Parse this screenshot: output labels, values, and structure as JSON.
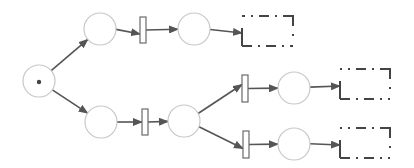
{
  "diagram": {
    "type": "petri-net",
    "colors": {
      "place_stroke": "#c8c8c8",
      "transition_stroke": "#6a6a6a",
      "arc": "#555555",
      "terminal": "#444444",
      "token": "#444444"
    },
    "places": [
      {
        "id": "p0",
        "cx": 39,
        "cy": 81,
        "r": 16,
        "tokens": 1
      },
      {
        "id": "p1",
        "cx": 100,
        "cy": 29,
        "r": 16,
        "tokens": 0
      },
      {
        "id": "p2",
        "cx": 194,
        "cy": 29,
        "r": 16,
        "tokens": 0
      },
      {
        "id": "p3",
        "cx": 101,
        "cy": 122,
        "r": 16,
        "tokens": 0
      },
      {
        "id": "p4",
        "cx": 184,
        "cy": 121,
        "r": 16,
        "tokens": 0
      },
      {
        "id": "p5",
        "cx": 294,
        "cy": 88,
        "r": 16,
        "tokens": 0
      },
      {
        "id": "p6",
        "cx": 294,
        "cy": 144,
        "r": 16,
        "tokens": 0
      }
    ],
    "transitions": [
      {
        "id": "t1",
        "x": 140,
        "y": 17,
        "w": 6,
        "h": 26
      },
      {
        "id": "t2",
        "x": 142,
        "y": 109,
        "w": 6,
        "h": 26
      },
      {
        "id": "t3",
        "x": 242,
        "y": 75,
        "w": 6,
        "h": 27
      },
      {
        "id": "t4",
        "x": 243,
        "y": 131,
        "w": 6,
        "h": 27
      }
    ],
    "terminals": [
      {
        "id": "end1",
        "x": 242,
        "y": 16,
        "w": 51,
        "h": 30
      },
      {
        "id": "end2",
        "x": 340,
        "y": 69,
        "w": 50,
        "h": 30
      },
      {
        "id": "end3",
        "x": 340,
        "y": 128,
        "w": 50,
        "h": 30
      }
    ],
    "arcs": [
      {
        "from": "p0",
        "to": "p1"
      },
      {
        "from": "p0",
        "to": "p3"
      },
      {
        "from": "p1",
        "to": "t1"
      },
      {
        "from": "t1",
        "to": "p2"
      },
      {
        "from": "p2",
        "to": "end1"
      },
      {
        "from": "p3",
        "to": "t2"
      },
      {
        "from": "t2",
        "to": "p4"
      },
      {
        "from": "p4",
        "to": "t3"
      },
      {
        "from": "p4",
        "to": "t4"
      },
      {
        "from": "t3",
        "to": "p5"
      },
      {
        "from": "t4",
        "to": "p6"
      },
      {
        "from": "p5",
        "to": "end2"
      },
      {
        "from": "p6",
        "to": "end3"
      }
    ]
  }
}
